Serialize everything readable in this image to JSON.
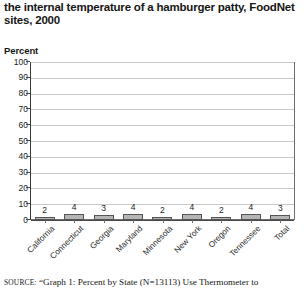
{
  "figure": {
    "title_lines": [
      "the internal temperature of a hamburger patty, FoodNet",
      "sites, 2000"
    ],
    "axis_label": "Percent",
    "source_label": "source:",
    "source_text": "“Graph 1: Percent by State (N=13113) Use Thermometer to"
  },
  "chart_data": {
    "type": "bar",
    "title": "the internal temperature of a hamburger patty, FoodNet sites, 2000",
    "xlabel": "",
    "ylabel": "Percent",
    "ylim": [
      0,
      100
    ],
    "ytick_values": [
      0,
      10,
      20,
      30,
      40,
      50,
      60,
      70,
      80,
      90,
      100
    ],
    "ytick_labels": [
      "0",
      "10",
      "20",
      "30",
      "40",
      "50",
      "60",
      "70",
      "80",
      "90",
      "100"
    ],
    "grid": true,
    "legend": "none",
    "bar_color": "#b5b5b5",
    "bar_edge_color": "#555555",
    "gridline_color": "#c9c9c9",
    "categories": [
      "California",
      "Connecticut",
      "Georgia",
      "Maryland",
      "Minnesota",
      "New York",
      "Oregon",
      "Tennessee",
      "Total"
    ],
    "values": [
      2,
      4,
      3,
      4,
      2,
      4,
      2,
      4,
      3
    ],
    "value_labels": [
      "2",
      "4",
      "3",
      "4",
      "2",
      "4",
      "2",
      "4",
      "3"
    ]
  }
}
